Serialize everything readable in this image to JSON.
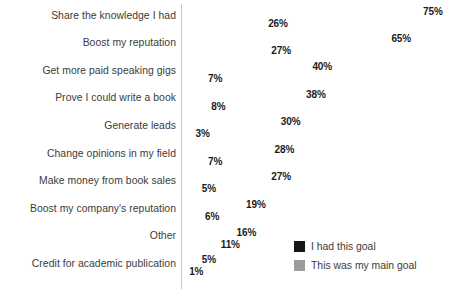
{
  "chart_data": {
    "type": "bar",
    "title": "",
    "subtitle": "",
    "xlabel": "",
    "ylabel": "",
    "orientation": "horizontal",
    "grid": false,
    "legend_position": "bottom-right",
    "xlim": [
      0,
      75
    ],
    "value_suffix": "%",
    "categories": [
      "Share the knowledge I had",
      "Boost my reputation",
      "Get more paid speaking gigs",
      "Prove I could write a book",
      "Generate leads",
      "Change opinions in my field",
      "Make money from book sales",
      "Boost my company's reputation",
      "Other",
      "Credit for academic publication"
    ],
    "series": [
      {
        "name": "I had this goal",
        "color": "#161616",
        "values": [
          75,
          65,
          40,
          38,
          30,
          28,
          27,
          19,
          16,
          5
        ],
        "labels": [
          "75%",
          "65%",
          "40%",
          "38%",
          "30%",
          "28%",
          "27%",
          "19%",
          "16%",
          "5%"
        ]
      },
      {
        "name": "This was my main goal",
        "color": "#9b9b9b",
        "values": [
          26,
          27,
          7,
          8,
          3,
          7,
          5,
          6,
          11,
          1
        ],
        "labels": [
          "26%",
          "27%",
          "7%",
          "8%",
          "3%",
          "7%",
          "5%",
          "6%",
          "11%",
          "1%"
        ]
      }
    ]
  },
  "legend": {
    "items": [
      {
        "label": "I had this goal",
        "color": "#161616"
      },
      {
        "label": "This was my main goal",
        "color": "#9b9b9b"
      }
    ]
  }
}
